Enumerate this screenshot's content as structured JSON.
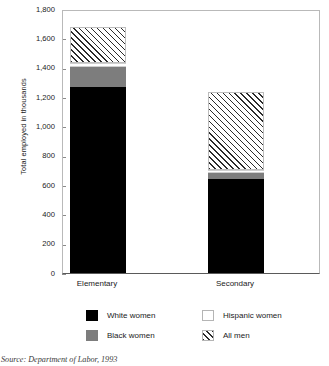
{
  "chart_data": {
    "type": "bar",
    "title": "",
    "subtitle": "",
    "xlabel": "",
    "ylabel": "Total employed in thousands",
    "categories": [
      "Elementary",
      "Secondary"
    ],
    "ylim": [
      0,
      1800
    ],
    "yticks": [
      "0",
      "200",
      "400",
      "600",
      "800",
      "1,000",
      "1,200",
      "1,400",
      "1,600",
      "1,800"
    ],
    "ytick_values": [
      0,
      200,
      400,
      600,
      800,
      1000,
      1200,
      1400,
      1600,
      1800
    ],
    "grid": false,
    "stacked": true,
    "legend_position": "bottom",
    "series": [
      {
        "name": "White women",
        "color": "#000000",
        "pattern": "solid",
        "values": [
          1270,
          640
        ]
      },
      {
        "name": "Black women",
        "color": "#7d7d7d",
        "pattern": "solid",
        "values": [
          134,
          42
        ]
      },
      {
        "name": "Hispanic women",
        "color": "#ffffff",
        "pattern": "solid",
        "values": [
          27,
          20
        ]
      },
      {
        "name": "All men",
        "color": "#ffffff",
        "pattern": "diagonal-hatch",
        "values": [
          246,
          532
        ]
      }
    ],
    "totals": [
      1677,
      1234
    ],
    "source_note": "Source: Department of Labor, 1993"
  },
  "legend": {
    "rows": [
      {
        "left": "White women",
        "right": "Hispanic women"
      },
      {
        "left": "Black women",
        "right": "All men"
      }
    ]
  }
}
